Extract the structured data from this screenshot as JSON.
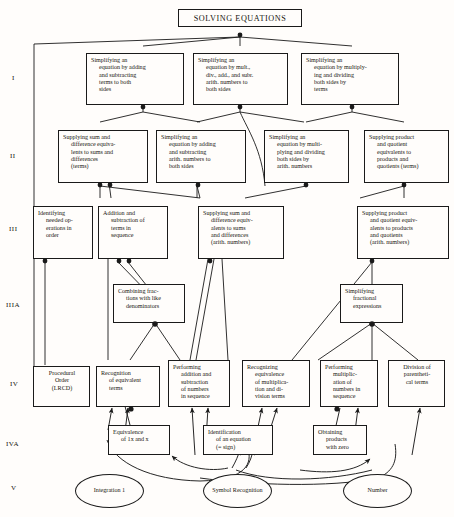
{
  "diagram": {
    "type": "learning-hierarchy",
    "title": "SOLVING EQUATIONS",
    "level_labels": [
      "I",
      "II",
      "III",
      "IIIA",
      "IV",
      "IVA",
      "V"
    ],
    "nodes": [
      {
        "id": "top",
        "level": "root",
        "shape": "box",
        "lines": [
          "SOLVING EQUATIONS"
        ]
      },
      {
        "id": "i1",
        "level": "I",
        "shape": "box",
        "lines": [
          "Simplifying an",
          "equation by adding",
          "and subtracting",
          "terms to both",
          "sides"
        ],
        "indent": [
          false,
          true,
          true,
          true,
          true
        ]
      },
      {
        "id": "i2",
        "level": "I",
        "shape": "box",
        "lines": [
          "Simplifying an",
          "equation by mult.,",
          "div., add., and subr.",
          "arith. numbers to",
          "both sides"
        ],
        "indent": [
          false,
          true,
          true,
          true,
          true
        ]
      },
      {
        "id": "i3",
        "level": "I",
        "shape": "box",
        "lines": [
          "Simplifying an",
          "equation by multiply-",
          "ing and dividing",
          "both sides by",
          "terms"
        ],
        "indent": [
          false,
          true,
          true,
          true,
          true
        ]
      },
      {
        "id": "ii1",
        "level": "II",
        "shape": "box",
        "lines": [
          "Supplying sum and",
          "difference equiva-",
          "lents to sums and",
          "differences",
          "(terms)"
        ],
        "indent": [
          false,
          true,
          true,
          true,
          true
        ]
      },
      {
        "id": "ii2",
        "level": "II",
        "shape": "box",
        "lines": [
          "Simplifying an",
          "equation by adding",
          "and subtracting",
          "arith. numbers to",
          "both sides"
        ],
        "indent": [
          false,
          true,
          true,
          true,
          true
        ]
      },
      {
        "id": "ii3",
        "level": "II",
        "shape": "box",
        "lines": [
          "Simplifying an",
          "equation by multi-",
          "plying and dividing",
          "both sides by",
          "arith. numbers"
        ],
        "indent": [
          false,
          true,
          true,
          true,
          true
        ]
      },
      {
        "id": "ii4",
        "level": "II",
        "shape": "box",
        "lines": [
          "Supplying product",
          "and quotient",
          "equivalents to",
          "products and",
          "quotients (terms)"
        ],
        "indent": [
          false,
          true,
          true,
          true,
          true
        ]
      },
      {
        "id": "iii1",
        "level": "III",
        "shape": "box",
        "lines": [
          "Identifying",
          "needed op-",
          "erations in",
          "order"
        ],
        "indent": [
          false,
          true,
          true,
          true
        ]
      },
      {
        "id": "iii2",
        "level": "III",
        "shape": "box",
        "lines": [
          "Addition and",
          "subtraction of",
          "terms in",
          "sequence"
        ],
        "indent": [
          false,
          true,
          true,
          true
        ]
      },
      {
        "id": "iii3",
        "level": "III",
        "shape": "box",
        "lines": [
          "Supplying sum and",
          "difference equiv-",
          "alents to sums",
          "and differences",
          "(arith. numbers)"
        ],
        "indent": [
          false,
          true,
          true,
          true,
          true
        ]
      },
      {
        "id": "iii4",
        "level": "III",
        "shape": "box",
        "lines": [
          "Supplying product",
          "and quotient equiv-",
          "alents to products",
          "and quotients",
          "(arith. numbers)"
        ],
        "indent": [
          false,
          true,
          true,
          true,
          true
        ]
      },
      {
        "id": "iiia1",
        "level": "IIIA",
        "shape": "box",
        "lines": [
          "Combining frac-",
          "tions with like",
          "denominators"
        ],
        "indent": [
          false,
          true,
          true
        ]
      },
      {
        "id": "iiia2",
        "level": "IIIA",
        "shape": "box",
        "lines": [
          "Simplifying",
          "fractional",
          "expressions"
        ],
        "indent": [
          false,
          true,
          true
        ]
      },
      {
        "id": "iv1",
        "level": "IV",
        "shape": "box",
        "lines": [
          "Procedural",
          "Order",
          "(LRCD)"
        ],
        "center": true
      },
      {
        "id": "iv2",
        "level": "IV",
        "shape": "box",
        "lines": [
          "Recognition",
          "of equivalent",
          "terms"
        ],
        "indent": [
          false,
          true,
          true
        ]
      },
      {
        "id": "iv3",
        "level": "IV",
        "shape": "box",
        "lines": [
          "Performing",
          "addition and",
          "subtraction",
          "of numbers",
          "in sequence"
        ],
        "indent": [
          false,
          true,
          true,
          true,
          true
        ]
      },
      {
        "id": "iv4",
        "level": "IV",
        "shape": "box",
        "lines": [
          "Recognizing",
          "equivalence",
          "of multiplica-",
          "tion and di-",
          "vision terms"
        ],
        "indent": [
          false,
          true,
          true,
          true,
          true
        ]
      },
      {
        "id": "iv5",
        "level": "IV",
        "shape": "box",
        "lines": [
          "Performing",
          "multiplic-",
          "ation of",
          "numbers in",
          "sequence"
        ],
        "indent": [
          false,
          true,
          true,
          true,
          true
        ]
      },
      {
        "id": "iv6",
        "level": "IV",
        "shape": "box",
        "lines": [
          "Division of",
          "parentheti-",
          "cal terms"
        ],
        "center": true
      },
      {
        "id": "iva1",
        "level": "IVA",
        "shape": "box",
        "lines": [
          "Equivalence",
          "of 1x and x"
        ],
        "indent": [
          false,
          true
        ]
      },
      {
        "id": "iva2",
        "level": "IVA",
        "shape": "box",
        "lines": [
          "Identification",
          "of an equation",
          "(= sign)"
        ],
        "indent": [
          false,
          true,
          true
        ]
      },
      {
        "id": "iva3",
        "level": "IVA",
        "shape": "box",
        "lines": [
          "Obtaining",
          "products",
          "with zero"
        ],
        "indent": [
          false,
          true,
          true
        ]
      },
      {
        "id": "v1",
        "level": "V",
        "shape": "ellipse",
        "lines": [
          "Integration 1"
        ]
      },
      {
        "id": "v2",
        "level": "V",
        "shape": "ellipse",
        "lines": [
          "Symbol",
          "Recognition"
        ]
      },
      {
        "id": "v3",
        "level": "V",
        "shape": "ellipse",
        "lines": [
          "Number"
        ]
      }
    ],
    "colors": {
      "line": "#1a1a1a",
      "text": "#17150f",
      "background": "#fffdfb"
    }
  }
}
